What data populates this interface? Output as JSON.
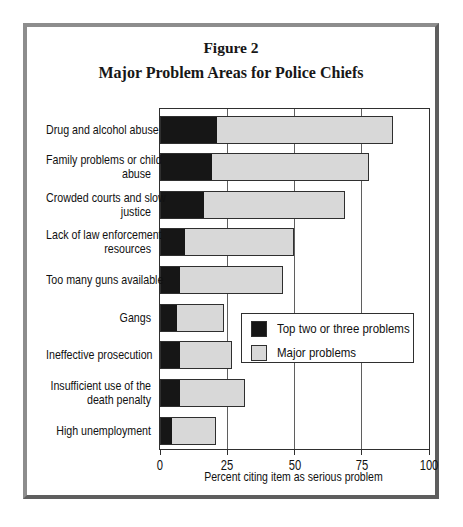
{
  "figure": {
    "number": "Figure 2",
    "title": "Major Problem Areas for Police Chiefs"
  },
  "chart_data": {
    "type": "bar",
    "orientation": "horizontal",
    "stacked": true,
    "title": "Major Problem Areas for Police Chiefs",
    "xlabel": "Percent citing item as serious problem",
    "xlim": [
      0,
      100
    ],
    "xticks": [
      0,
      25,
      50,
      75,
      100
    ],
    "grid": "vertical gridlines at each x tick",
    "categories": [
      "Drug and alcohol abuse",
      "Family problems or child abuse",
      "Crowded courts and slow justice",
      "Lack of law enforcement resources",
      "Too many guns available",
      "Gangs",
      "Ineffective prosecution",
      "Insufficient use of the death penalty",
      "High unemployment"
    ],
    "category_label_lines": [
      [
        "Drug and alcohol abuse"
      ],
      [
        "Family problems or child",
        "abuse"
      ],
      [
        "Crowded courts and slow",
        "justice"
      ],
      [
        "Lack of law enforcement",
        "resources"
      ],
      [
        "Too many guns available"
      ],
      [
        "Gangs"
      ],
      [
        "Ineffective prosecution"
      ],
      [
        "Insufficient use of the",
        "death penalty"
      ],
      [
        "High unemployment"
      ]
    ],
    "series": [
      {
        "name": "Top two or three problems",
        "color": "#161616",
        "values": [
          21,
          19,
          16,
          9,
          7,
          6,
          7,
          7,
          4
        ]
      },
      {
        "name": "Major problems",
        "color": "#d8d8d8",
        "values": [
          86,
          77,
          68,
          49,
          45,
          23,
          26,
          31,
          20
        ],
        "note": "total bar extent; gray segment spans from the black value to this total"
      }
    ],
    "legend": {
      "position": "inside middle-right"
    }
  },
  "colors": {
    "bar_black": "#161616",
    "bar_gray": "#d8d8d8",
    "bar_outline": "#2f2f2f",
    "gridline": "#5f5f5f",
    "plot_frame": "#2f2f2f",
    "figure_border_light": "#8d8d8d",
    "figure_border_dark": "#5e5e5e",
    "background": "#ffffff",
    "text": "#111111"
  }
}
